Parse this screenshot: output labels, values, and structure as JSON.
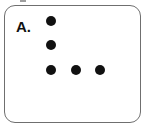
{
  "figure": {
    "label": "A.",
    "label_position": {
      "x": 11,
      "y": 13
    },
    "panel": {
      "x": 4,
      "y": 5,
      "width": 137,
      "height": 118,
      "corner_radius": 11,
      "border_color": "#6f6f6f",
      "border_width": 1.4,
      "fill_color": "#ffffff"
    },
    "artifact": {
      "x": 20,
      "y": 0,
      "width": 6,
      "height": 2,
      "color": "#8d8d8d"
    }
  },
  "chart_data": {
    "type": "scatter",
    "title": "A.",
    "xlabel": "",
    "ylabel": "",
    "marker": {
      "shape": "circle",
      "color": "#111111",
      "radius": 5
    },
    "grid": false,
    "legend": null,
    "axis_visible": false,
    "xlim": [
      4,
      141
    ],
    "ylim": [
      5,
      123
    ],
    "point_count": 5,
    "points": [
      {
        "id": "p1",
        "x": 51,
        "y": 21
      },
      {
        "id": "p2",
        "x": 51,
        "y": 45
      },
      {
        "id": "p3",
        "x": 51,
        "y": 70
      },
      {
        "id": "p4",
        "x": 76,
        "y": 70
      },
      {
        "id": "p5",
        "x": 100,
        "y": 70
      }
    ]
  }
}
